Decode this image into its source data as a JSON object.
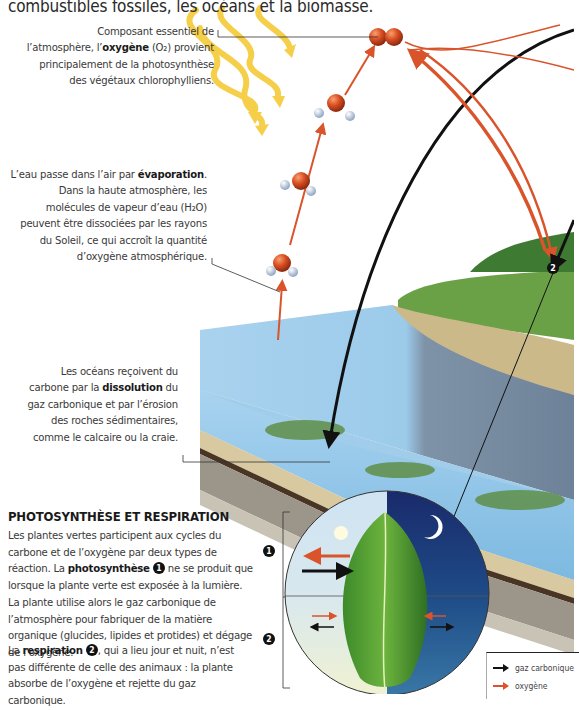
{
  "header": {
    "title_line": "combustibles fossiles, les océans et la biomasse."
  },
  "captions": {
    "oxygen": {
      "line1": "Composant essentiel de",
      "line2_pre": "l’atmosphère, l’",
      "line2_bold": "oxygène",
      "line2_post": " (O₂) provient",
      "line3": "principalement de la photosynthèse",
      "line4": "des végétaux chlorophylliens."
    },
    "evaporation": {
      "line1_pre": "L’eau passe dans l’air par ",
      "line1_bold": "évaporation",
      "line1_post": ".",
      "line2": "Dans la haute atmosphère, les",
      "line3": "molécules de vapeur d’eau (H₂O)",
      "line4": "peuvent être dissociées par les rayons",
      "line5": "du Soleil, ce qui accroît la quantité",
      "line6": "d’oxygène atmosphérique."
    },
    "oceans": {
      "line1": "Les océans reçoivent du",
      "line2_pre": "carbone par la ",
      "line2_bold": "dissolution",
      "line2_post": " du",
      "line3": "gaz carbonique et par l’érosion",
      "line4": "des roches sédimentaires,",
      "line5": "comme le calcaire ou la craie."
    }
  },
  "section": {
    "title": "PHOTOSYNTHÈSE ET RESPIRATION",
    "p1_a": "Les plantes vertes participent aux cycles du carbone et de l’oxygène par deux types de réaction. La ",
    "p1_bold": "photosynthèse",
    "p1_num": "1",
    "p1_b": " ne se produit que lorsque la plante verte est exposée à la lumière. La plante utilise alors le gaz carbonique de l’atmosphère pour fabriquer de la matière organique (glucides, lipides et protides) et dégage de l’oxygène.",
    "p2_a": "La ",
    "p2_bold": "respiration",
    "p2_num": "2",
    "p2_b": ", qui a lieu jour et nuit, n’est pas différente de celle des animaux : la plante absorbe de l’oxygène et rejette du gaz carbonique."
  },
  "diagram": {
    "marker_1": "1",
    "marker_2": "2",
    "land_marker": "2",
    "icons": [
      "sun-icon",
      "moon-icon",
      "leaf-icon",
      "oxygen-molecule-icon",
      "water-molecule-icon"
    ]
  },
  "legend": {
    "items": [
      {
        "label": "gaz carbonique",
        "color": "#111111"
      },
      {
        "label": "oxygène",
        "color": "#e0502a"
      }
    ]
  },
  "colors": {
    "oxygen_arrow": "#d9542b",
    "co2_arrow": "#111111",
    "sun_ray": "#f6cf4a",
    "water": "#9cc9e8",
    "grass": "#5d8f3a"
  }
}
